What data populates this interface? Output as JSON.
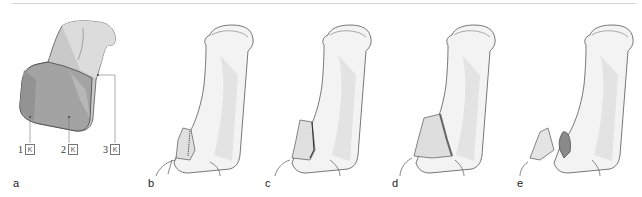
{
  "figure": {
    "panels": [
      {
        "id": "a",
        "label": "a"
      },
      {
        "id": "b",
        "label": "b"
      },
      {
        "id": "c",
        "label": "c"
      },
      {
        "id": "d",
        "label": "d"
      },
      {
        "id": "e",
        "label": "e"
      }
    ],
    "callouts": [
      {
        "number": "1",
        "icon": "K"
      },
      {
        "number": "2",
        "icon": "K"
      },
      {
        "number": "3",
        "icon": "K"
      }
    ],
    "colors": {
      "outline": "#555555",
      "tooth_light": "#e6e6e6",
      "tooth_mid": "#c8c8c8",
      "tooth_dark": "#9a9a9a",
      "tooth_darker": "#8c8c8c",
      "restoration": "#808080",
      "topline": "#d4d4d4"
    }
  }
}
